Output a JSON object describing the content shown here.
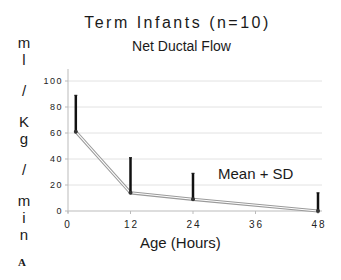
{
  "chart_data": {
    "type": "line",
    "title": "Term Infants (n=10)",
    "subtitle": "Net Ductal Flow",
    "xlabel": "Age (Hours)",
    "ylabel": "ml/Kg/min",
    "ylabel_chars": [
      "m",
      "l",
      "",
      "/",
      "",
      "K",
      "g",
      "",
      "/",
      "",
      "m",
      "i",
      "n"
    ],
    "x_ticks": [
      0,
      12,
      24,
      36,
      48
    ],
    "y_ticks": [
      0,
      20,
      40,
      60,
      80,
      100
    ],
    "xlim": [
      0,
      48
    ],
    "ylim": [
      0,
      100
    ],
    "grid": true,
    "annotation": "Mean + SD",
    "panel_label": "A",
    "series": [
      {
        "name": "Mean",
        "x": [
          1.5,
          12,
          24,
          48
        ],
        "values": [
          61,
          14,
          9,
          0
        ],
        "sd_upper": [
          89,
          41,
          29,
          14
        ]
      }
    ],
    "colors": {
      "line": "#9a9a9a",
      "error_bar": "#111111",
      "grid": "#e2e2e2",
      "axis": "#bbbbbb"
    }
  }
}
